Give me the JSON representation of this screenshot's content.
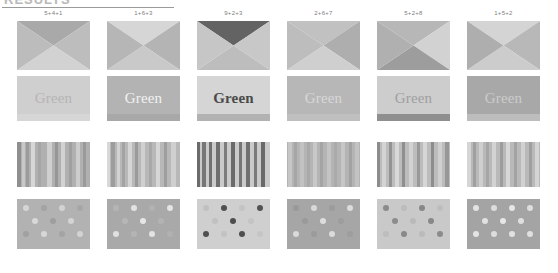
{
  "header": {
    "title": "RESULTS",
    "rule_visible": true
  },
  "layout": {
    "tile_width": 73,
    "tile_height": 49,
    "column_x": [
      17,
      107,
      197,
      287,
      377,
      467
    ],
    "row_y": [
      11,
      77,
      143,
      200
    ],
    "row_heights": [
      49,
      45,
      45,
      50
    ]
  },
  "columns": [
    {
      "label": "5+4+1"
    },
    {
      "label": "1+6+3"
    },
    {
      "label": "9+2+3"
    },
    {
      "label": "2+6+7"
    },
    {
      "label": "5+2+8"
    },
    {
      "label": "1+5+2"
    }
  ],
  "rows": [
    {
      "name": "x-pattern-row",
      "cells": [
        {
          "top": "#a9a9a9",
          "right": "#bdbdbd",
          "bottom": "#d2d2d2",
          "left": "#bcbcbc"
        },
        {
          "top": "#d6d6d6",
          "right": "#b4b4b4",
          "bottom": "#c9c9c9",
          "left": "#b6b6b6"
        },
        {
          "top": "#636363",
          "right": "#c8c8c8",
          "bottom": "#bdbdbd",
          "left": "#c6c6c6"
        },
        {
          "top": "#c1c1c1",
          "right": "#aeaeae",
          "bottom": "#cfcfcf",
          "left": "#bdbdbd"
        },
        {
          "top": "#b7b7b7",
          "right": "#d2d2d2",
          "bottom": "#9d9d9d",
          "left": "#b0b0b0"
        },
        {
          "top": "#d4d4d4",
          "right": "#b8b8b8",
          "bottom": "#cccccc",
          "left": "#aeaeae"
        }
      ]
    },
    {
      "name": "green-text-row",
      "cells": [
        {
          "word": "Green",
          "bg": "#cfcfcf",
          "fg": "#b5b5b5",
          "band": "#d6d6d6",
          "weight": "normal"
        },
        {
          "word": "Green",
          "bg": "#b3b3b3",
          "fg": "#f2f2f2",
          "band": "#a8a8a8",
          "weight": "normal"
        },
        {
          "word": "Green",
          "bg": "#d5d5d5",
          "fg": "#4a4a4a",
          "band": "#b2b2b2",
          "weight": "bold"
        },
        {
          "word": "Green",
          "bg": "#b7b7b7",
          "fg": "#d7d7d7",
          "band": "#bfbfbf",
          "weight": "normal"
        },
        {
          "word": "Green",
          "bg": "#cdcdcd",
          "fg": "#9f9f9f",
          "band": "#8f8f8f",
          "weight": "normal"
        },
        {
          "word": "Green",
          "bg": "#a8a8a8",
          "fg": "#cccccc",
          "band": "#bdbdbd",
          "weight": "normal"
        }
      ]
    },
    {
      "name": "stripes-row",
      "cells": [
        {
          "bg": "#b0b0b0",
          "stripes": [
            {
              "x": 0,
              "w": 4,
              "c": "#8f8f8f"
            },
            {
              "x": 5,
              "w": 3,
              "c": "#c8c8c8"
            },
            {
              "x": 9,
              "w": 3,
              "c": "#9b9b9b"
            },
            {
              "x": 14,
              "w": 4,
              "c": "#d6d6d6"
            },
            {
              "x": 21,
              "w": 3,
              "c": "#a5a5a5"
            },
            {
              "x": 30,
              "w": 5,
              "c": "#cfcfcf"
            },
            {
              "x": 38,
              "w": 3,
              "c": "#969696"
            },
            {
              "x": 44,
              "w": 4,
              "c": "#d2d2d2"
            },
            {
              "x": 52,
              "w": 3,
              "c": "#a0a0a0"
            },
            {
              "x": 59,
              "w": 4,
              "c": "#cdcdcd"
            },
            {
              "x": 66,
              "w": 3,
              "c": "#9a9a9a"
            }
          ]
        },
        {
          "bg": "#b8b8b8",
          "stripes": [
            {
              "x": 0,
              "w": 3,
              "c": "#d8d8d8"
            },
            {
              "x": 4,
              "w": 4,
              "c": "#9d9d9d"
            },
            {
              "x": 10,
              "w": 3,
              "c": "#d2d2d2"
            },
            {
              "x": 15,
              "w": 3,
              "c": "#a3a3a3"
            },
            {
              "x": 21,
              "w": 4,
              "c": "#d5d5d5"
            },
            {
              "x": 28,
              "w": 3,
              "c": "#9a9a9a"
            },
            {
              "x": 34,
              "w": 4,
              "c": "#d0d0d0"
            },
            {
              "x": 42,
              "w": 3,
              "c": "#a8a8a8"
            },
            {
              "x": 49,
              "w": 4,
              "c": "#d6d6d6"
            },
            {
              "x": 57,
              "w": 3,
              "c": "#9e9e9e"
            },
            {
              "x": 64,
              "w": 5,
              "c": "#cfcfcf"
            }
          ]
        },
        {
          "bg": "#cacaca",
          "stripes": [
            {
              "x": 0,
              "w": 3,
              "c": "#6b6b6b"
            },
            {
              "x": 5,
              "w": 4,
              "c": "#777777"
            },
            {
              "x": 12,
              "w": 3,
              "c": "#707070"
            },
            {
              "x": 19,
              "w": 4,
              "c": "#6e6e6e"
            },
            {
              "x": 27,
              "w": 3,
              "c": "#7c7c7c"
            },
            {
              "x": 34,
              "w": 4,
              "c": "#6a6a6a"
            },
            {
              "x": 42,
              "w": 3,
              "c": "#757575"
            },
            {
              "x": 49,
              "w": 4,
              "c": "#6f6f6f"
            },
            {
              "x": 57,
              "w": 3,
              "c": "#7a7a7a"
            },
            {
              "x": 64,
              "w": 4,
              "c": "#696969"
            }
          ]
        },
        {
          "bg": "#b4b4b4",
          "stripes": [
            {
              "x": 1,
              "w": 4,
              "c": "#c6c6c6"
            },
            {
              "x": 7,
              "w": 3,
              "c": "#a6a6a6"
            },
            {
              "x": 13,
              "w": 4,
              "c": "#c2c2c2"
            },
            {
              "x": 20,
              "w": 3,
              "c": "#a9a9a9"
            },
            {
              "x": 26,
              "w": 4,
              "c": "#c8c8c8"
            },
            {
              "x": 33,
              "w": 3,
              "c": "#a4a4a4"
            },
            {
              "x": 40,
              "w": 4,
              "c": "#c4c4c4"
            },
            {
              "x": 47,
              "w": 3,
              "c": "#aaaaaa"
            },
            {
              "x": 54,
              "w": 4,
              "c": "#c7c7c7"
            },
            {
              "x": 62,
              "w": 3,
              "c": "#a2a2a2"
            },
            {
              "x": 68,
              "w": 4,
              "c": "#c3c3c3"
            }
          ]
        },
        {
          "bg": "#bcbcbc",
          "stripes": [
            {
              "x": 0,
              "w": 3,
              "c": "#8c8c8c"
            },
            {
              "x": 5,
              "w": 4,
              "c": "#d4d4d4"
            },
            {
              "x": 12,
              "w": 3,
              "c": "#929292"
            },
            {
              "x": 18,
              "w": 4,
              "c": "#d8d8d8"
            },
            {
              "x": 25,
              "w": 3,
              "c": "#8f8f8f"
            },
            {
              "x": 32,
              "w": 4,
              "c": "#d2d2d2"
            },
            {
              "x": 40,
              "w": 3,
              "c": "#999999"
            },
            {
              "x": 46,
              "w": 4,
              "c": "#d6d6d6"
            },
            {
              "x": 54,
              "w": 3,
              "c": "#8d8d8d"
            },
            {
              "x": 61,
              "w": 4,
              "c": "#d0d0d0"
            },
            {
              "x": 68,
              "w": 4,
              "c": "#979797"
            }
          ]
        },
        {
          "bg": "#b9b9b9",
          "stripes": [
            {
              "x": 0,
              "w": 4,
              "c": "#d5d5d5"
            },
            {
              "x": 6,
              "w": 3,
              "c": "#a0a0a0"
            },
            {
              "x": 12,
              "w": 4,
              "c": "#cfcfcf"
            },
            {
              "x": 19,
              "w": 3,
              "c": "#a6a6a6"
            },
            {
              "x": 25,
              "w": 4,
              "c": "#d3d3d3"
            },
            {
              "x": 33,
              "w": 3,
              "c": "#9d9d9d"
            },
            {
              "x": 39,
              "w": 4,
              "c": "#d7d7d7"
            },
            {
              "x": 47,
              "w": 3,
              "c": "#a3a3a3"
            },
            {
              "x": 54,
              "w": 4,
              "c": "#d1d1d1"
            },
            {
              "x": 62,
              "w": 3,
              "c": "#9f9f9f"
            },
            {
              "x": 68,
              "w": 4,
              "c": "#d4d4d4"
            }
          ]
        }
      ]
    },
    {
      "name": "dots-row",
      "cells": [
        {
          "bg": "#b2b2b2",
          "dot_radius": 3.2,
          "dots": [
            {
              "x": 9,
              "y": 9,
              "c": "#d6d6d6"
            },
            {
              "x": 27,
              "y": 9,
              "c": "#a3a3a3"
            },
            {
              "x": 45,
              "y": 9,
              "c": "#d2d2d2"
            },
            {
              "x": 63,
              "y": 9,
              "c": "#a6a6a6"
            },
            {
              "x": 18,
              "y": 22,
              "c": "#d8d8d8"
            },
            {
              "x": 36,
              "y": 22,
              "c": "#9e9e9e"
            },
            {
              "x": 54,
              "y": 22,
              "c": "#d4d4d4"
            },
            {
              "x": 9,
              "y": 35,
              "c": "#a1a1a1"
            },
            {
              "x": 27,
              "y": 35,
              "c": "#d7d7d7"
            },
            {
              "x": 45,
              "y": 35,
              "c": "#a4a4a4"
            },
            {
              "x": 63,
              "y": 35,
              "c": "#d3d3d3"
            }
          ]
        },
        {
          "bg": "#a9a9a9",
          "dot_radius": 3.4,
          "dots": [
            {
              "x": 9,
              "y": 9,
              "c": "#b5b5b5"
            },
            {
              "x": 27,
              "y": 9,
              "c": "#e2e2e2"
            },
            {
              "x": 45,
              "y": 9,
              "c": "#b2b2b2"
            },
            {
              "x": 63,
              "y": 9,
              "c": "#e4e4e4"
            },
            {
              "x": 18,
              "y": 22,
              "c": "#b6b6b6"
            },
            {
              "x": 36,
              "y": 22,
              "c": "#e6e6e6"
            },
            {
              "x": 54,
              "y": 22,
              "c": "#b3b3b3"
            },
            {
              "x": 9,
              "y": 35,
              "c": "#e0e0e0"
            },
            {
              "x": 27,
              "y": 35,
              "c": "#b4b4b4"
            },
            {
              "x": 45,
              "y": 35,
              "c": "#e3e3e3"
            },
            {
              "x": 63,
              "y": 35,
              "c": "#b1b1b1"
            }
          ]
        },
        {
          "bg": "#cfcfcf",
          "dot_radius": 3.4,
          "dots": [
            {
              "x": 9,
              "y": 9,
              "c": "#c0c0c0"
            },
            {
              "x": 27,
              "y": 9,
              "c": "#4f4f4f"
            },
            {
              "x": 45,
              "y": 9,
              "c": "#c3c3c3"
            },
            {
              "x": 63,
              "y": 9,
              "c": "#525252"
            },
            {
              "x": 18,
              "y": 22,
              "c": "#c1c1c1"
            },
            {
              "x": 36,
              "y": 22,
              "c": "#4d4d4d"
            },
            {
              "x": 54,
              "y": 22,
              "c": "#c4c4c4"
            },
            {
              "x": 9,
              "y": 35,
              "c": "#505050"
            },
            {
              "x": 27,
              "y": 35,
              "c": "#c2c2c2"
            },
            {
              "x": 45,
              "y": 35,
              "c": "#4e4e4e"
            },
            {
              "x": 63,
              "y": 35,
              "c": "#c5c5c5"
            }
          ]
        },
        {
          "bg": "#a6a6a6",
          "dot_radius": 3.2,
          "dots": [
            {
              "x": 9,
              "y": 9,
              "c": "#999999"
            },
            {
              "x": 27,
              "y": 9,
              "c": "#d9d9d9"
            },
            {
              "x": 45,
              "y": 9,
              "c": "#9c9c9c"
            },
            {
              "x": 63,
              "y": 9,
              "c": "#dcdcdc"
            },
            {
              "x": 18,
              "y": 22,
              "c": "#9a9a9a"
            },
            {
              "x": 36,
              "y": 22,
              "c": "#dddddd"
            },
            {
              "x": 54,
              "y": 22,
              "c": "#9d9d9d"
            },
            {
              "x": 9,
              "y": 35,
              "c": "#dadada"
            },
            {
              "x": 27,
              "y": 35,
              "c": "#9b9b9b"
            },
            {
              "x": 45,
              "y": 35,
              "c": "#dbdbdb"
            },
            {
              "x": 63,
              "y": 35,
              "c": "#9e9e9e"
            }
          ]
        },
        {
          "bg": "#c9c9c9",
          "dot_radius": 3.3,
          "dots": [
            {
              "x": 9,
              "y": 9,
              "c": "#8a8a8a"
            },
            {
              "x": 27,
              "y": 9,
              "c": "#bcbcbc"
            },
            {
              "x": 45,
              "y": 9,
              "c": "#878787"
            },
            {
              "x": 63,
              "y": 9,
              "c": "#bebebe"
            },
            {
              "x": 18,
              "y": 22,
              "c": "#8c8c8c"
            },
            {
              "x": 36,
              "y": 22,
              "c": "#bababa"
            },
            {
              "x": 54,
              "y": 22,
              "c": "#888888"
            },
            {
              "x": 9,
              "y": 35,
              "c": "#bdbdbd"
            },
            {
              "x": 27,
              "y": 35,
              "c": "#898989"
            },
            {
              "x": 45,
              "y": 35,
              "c": "#bbbbbb"
            },
            {
              "x": 63,
              "y": 35,
              "c": "#8b8b8b"
            }
          ]
        },
        {
          "bg": "#a4a4a4",
          "dot_radius": 3.4,
          "dots": [
            {
              "x": 9,
              "y": 9,
              "c": "#e3e3e3"
            },
            {
              "x": 27,
              "y": 9,
              "c": "#dcdcdc"
            },
            {
              "x": 45,
              "y": 9,
              "c": "#e5e5e5"
            },
            {
              "x": 63,
              "y": 9,
              "c": "#dedede"
            },
            {
              "x": 18,
              "y": 22,
              "c": "#e1e1e1"
            },
            {
              "x": 36,
              "y": 22,
              "c": "#e6e6e6"
            },
            {
              "x": 54,
              "y": 22,
              "c": "#dfdfdf"
            },
            {
              "x": 9,
              "y": 35,
              "c": "#e4e4e4"
            },
            {
              "x": 27,
              "y": 35,
              "c": "#dddddd"
            },
            {
              "x": 45,
              "y": 35,
              "c": "#e2e2e2"
            },
            {
              "x": 63,
              "y": 35,
              "c": "#e0e0e0"
            }
          ]
        }
      ]
    }
  ]
}
